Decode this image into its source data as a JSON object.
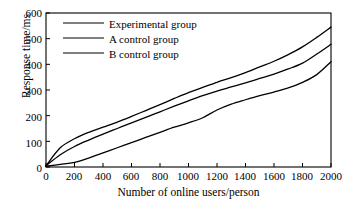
{
  "chart_data": {
    "type": "line",
    "title": "",
    "xlabel": "Number of online users/person",
    "ylabel": "Response time/ms",
    "xlim": [
      0,
      2000
    ],
    "ylim": [
      0,
      600
    ],
    "xticks": [
      0,
      200,
      400,
      600,
      800,
      1000,
      1200,
      1400,
      1600,
      1800,
      2000
    ],
    "yticks": [
      0,
      100,
      200,
      300,
      400,
      500,
      600
    ],
    "grid": false,
    "legend_position": "top-left-inside",
    "x": [
      0,
      100,
      200,
      300,
      400,
      500,
      600,
      700,
      800,
      900,
      1000,
      1100,
      1200,
      1300,
      1400,
      1500,
      1600,
      1700,
      1800,
      1900,
      2000
    ],
    "series": [
      {
        "name": "Experimental group",
        "color": "#000000",
        "values": [
          5,
          75,
          110,
          135,
          155,
          175,
          197,
          220,
          243,
          267,
          290,
          310,
          330,
          348,
          368,
          390,
          412,
          438,
          468,
          505,
          545
        ]
      },
      {
        "name": "A control group",
        "color": "#000000",
        "values": [
          5,
          48,
          80,
          105,
          128,
          150,
          172,
          193,
          215,
          237,
          258,
          278,
          296,
          312,
          328,
          345,
          362,
          382,
          405,
          440,
          478
        ]
      },
      {
        "name": "B control group",
        "color": "#000000",
        "values": [
          3,
          10,
          18,
          35,
          55,
          75,
          95,
          115,
          135,
          155,
          172,
          192,
          222,
          245,
          262,
          278,
          292,
          308,
          330,
          360,
          410
        ]
      }
    ]
  },
  "axes": {
    "y_tick_labels": [
      "600",
      "500",
      "400",
      "300",
      "200",
      "100",
      "0"
    ],
    "x_tick_labels": [
      "0",
      "200",
      "400",
      "600",
      "800",
      "1000",
      "1200",
      "1400",
      "1600",
      "1800",
      "2000"
    ],
    "y_axis_title": "Response time/ms",
    "x_axis_title": "Number of online users/person"
  },
  "legend": {
    "items": [
      {
        "label": "Experimental group"
      },
      {
        "label": "A control group"
      },
      {
        "label": "B control group"
      }
    ]
  }
}
